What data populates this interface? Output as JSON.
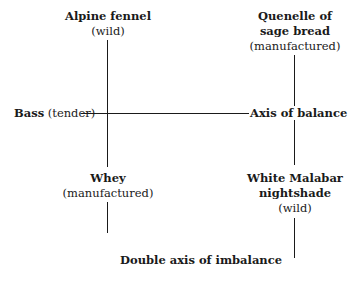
{
  "diagram": {
    "top_left": {
      "name": "Alpine fennel",
      "qualifier": "(wild)"
    },
    "top_right": {
      "name_line1": "Quenelle of",
      "name_line2": "sage bread",
      "qualifier": "(manufactured)"
    },
    "middle_left": {
      "name": "Bass",
      "qualifier": "(tender)"
    },
    "middle_right": {
      "name": "Axis of balance"
    },
    "bottom_left": {
      "name": "Whey",
      "qualifier": "(manufactured)"
    },
    "bottom_right": {
      "name_line1": "White Malabar",
      "name_line2": "nightshade",
      "qualifier": "(wild)"
    },
    "bottom_caption": "Double axis of imbalance"
  },
  "colors": {
    "line": "#1a1a1a",
    "background": "#ffffff"
  }
}
